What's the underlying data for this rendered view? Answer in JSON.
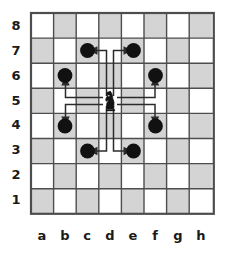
{
  "diagram": {
    "piece": {
      "name": "knight",
      "color": "black",
      "square": "d5",
      "file_index": 3,
      "rank_index": 4
    },
    "board": {
      "files": [
        "a",
        "b",
        "c",
        "d",
        "e",
        "f",
        "g",
        "h"
      ],
      "ranks": [
        "8",
        "7",
        "6",
        "5",
        "4",
        "3",
        "2",
        "1"
      ],
      "light_square_color": "#ffffff",
      "dark_square_color": "#d4d4d4",
      "grid_line_color": "#4d4d4d",
      "border_color": "#4d4d4d",
      "label_color": "#1a1a1a"
    },
    "markers": {
      "color": "#111111",
      "squares": [
        "c7",
        "e7",
        "b6",
        "f6",
        "b4",
        "f4",
        "c3",
        "e3"
      ]
    },
    "arrows": {
      "color": "#2b2b2b",
      "from": "d5",
      "moves": [
        {
          "to": "c7",
          "path": "up-left"
        },
        {
          "to": "e7",
          "path": "up-right"
        },
        {
          "to": "b6",
          "path": "left-up"
        },
        {
          "to": "f6",
          "path": "right-up"
        },
        {
          "to": "b4",
          "path": "left-down"
        },
        {
          "to": "f4",
          "path": "right-down"
        },
        {
          "to": "c3",
          "path": "down-left"
        },
        {
          "to": "e3",
          "path": "down-right"
        }
      ]
    }
  }
}
